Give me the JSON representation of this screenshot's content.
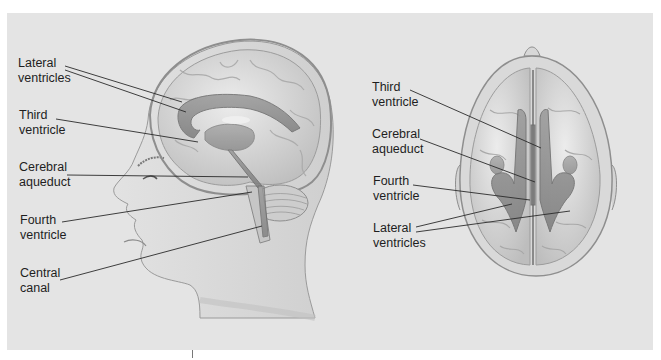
{
  "figure": {
    "background_color": "#e4e4e4",
    "ventricle_color": "#8a8a8a",
    "brain_color": "#d6d6d6",
    "leader_line_color": "#2a2a2a",
    "views": [
      {
        "name": "lateral-view",
        "description": "Side profile of head showing brain and ventricular system",
        "labels": [
          {
            "text": "Lateral\nventricles"
          },
          {
            "text": "Third\nventricle"
          },
          {
            "text": "Cerebral\naqueduct"
          },
          {
            "text": "Fourth\nventricle"
          },
          {
            "text": "Central\ncanal"
          }
        ]
      },
      {
        "name": "superior-view",
        "description": "Top-down view of brain showing ventricular system",
        "labels": [
          {
            "text": "Third\nventricle"
          },
          {
            "text": "Cerebral\naqueduct"
          },
          {
            "text": "Fourth\nventricle"
          },
          {
            "text": "Lateral\nventricles"
          }
        ]
      }
    ]
  }
}
